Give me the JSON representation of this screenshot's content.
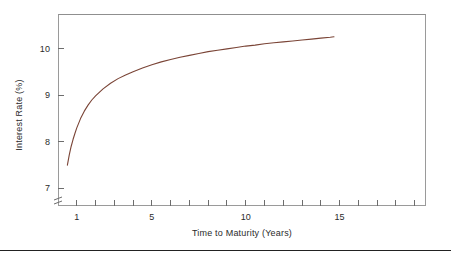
{
  "chart_data": {
    "type": "line",
    "title": "",
    "xlabel": "Time to Maturity (Years)",
    "ylabel": "Interest Rate (%)",
    "xlim": [
      0,
      19.6
    ],
    "ylim": [
      6.62,
      10.75
    ],
    "grid": false,
    "legend": "none",
    "y_axis_break": true,
    "y_axis_break_symbol": "≈",
    "xticks": [
      1,
      2,
      3,
      4,
      5,
      6,
      7,
      8,
      9,
      10,
      11,
      12,
      13,
      14,
      15,
      16,
      17,
      18,
      19
    ],
    "xtick_labels": [
      {
        "value": 1,
        "label": "1"
      },
      {
        "value": 5,
        "label": "5"
      },
      {
        "value": 10,
        "label": "10"
      },
      {
        "value": 15,
        "label": "15"
      }
    ],
    "yticks": [
      7,
      8,
      9,
      10
    ],
    "ytick_labels": [
      "7",
      "8",
      "9",
      "10"
    ],
    "series": [
      {
        "name": "Yield Curve",
        "color": "#7a4436",
        "linewidth": 1.1,
        "x": [
          0.5,
          0.6,
          0.7,
          0.8,
          0.9,
          1.0,
          1.2,
          1.4,
          1.6,
          1.8,
          2.0,
          2.4,
          2.8,
          3.2,
          3.6,
          4.0,
          4.5,
          5.0,
          5.5,
          6.0,
          6.5,
          7.0,
          7.5,
          8.0,
          8.5,
          9.0,
          9.5,
          10.0,
          10.5,
          11.0,
          11.5,
          12.0,
          12.5,
          13.0,
          13.5,
          14.0,
          14.5,
          14.7
        ],
        "y": [
          7.5,
          7.72,
          7.9,
          8.05,
          8.18,
          8.3,
          8.5,
          8.66,
          8.79,
          8.9,
          8.99,
          9.14,
          9.26,
          9.36,
          9.44,
          9.51,
          9.59,
          9.66,
          9.72,
          9.77,
          9.82,
          9.86,
          9.9,
          9.94,
          9.97,
          10.0,
          10.03,
          10.06,
          10.08,
          10.11,
          10.13,
          10.15,
          10.17,
          10.19,
          10.21,
          10.23,
          10.25,
          10.26
        ]
      }
    ]
  },
  "axes": {
    "frame_color": "#9a9a9a",
    "tick_color": "#6d6d6d",
    "text_color": "#2b2b2b"
  },
  "figure": {
    "background": "#ffffff"
  }
}
